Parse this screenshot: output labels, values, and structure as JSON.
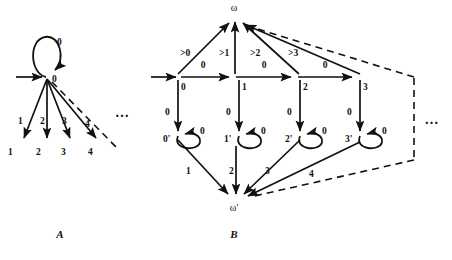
{
  "figure": {
    "caption_a": "A",
    "caption_b": "B",
    "ellipsis": "…"
  },
  "diagram_a": {
    "caption": "A",
    "start_node_label": "0",
    "self_loop_label": "0",
    "ellipsis": "…",
    "edges": [
      {
        "label": "1",
        "target_label": "1"
      },
      {
        "label": "2",
        "target_label": "2"
      },
      {
        "label": "3",
        "target_label": "3"
      },
      {
        "label": "4",
        "target_label": "4"
      }
    ],
    "leaf_labels": [
      "1",
      "2",
      "3",
      "4"
    ],
    "edge_labels": [
      "1",
      "2",
      "3",
      "4"
    ]
  },
  "diagram_b": {
    "caption": "B",
    "top_node_label": "ω",
    "bottom_node_label": "ω'",
    "ellipsis": "…",
    "middle_nodes": [
      "0",
      "1",
      "2",
      "3"
    ],
    "bottom_nodes": [
      "0'",
      "1'",
      "2'",
      "3'"
    ],
    "horizontal_edge_labels": [
      "0",
      "0",
      "0"
    ],
    "to_omega_labels": [
      ">0",
      ">1",
      ">2",
      ">3"
    ],
    "down_edge_labels": [
      "0",
      "0",
      "0",
      "0"
    ],
    "self_loop_labels": [
      "0",
      "0",
      "0",
      "0"
    ],
    "to_omega_prime_labels": [
      "1",
      "2",
      "3",
      "4"
    ]
  }
}
